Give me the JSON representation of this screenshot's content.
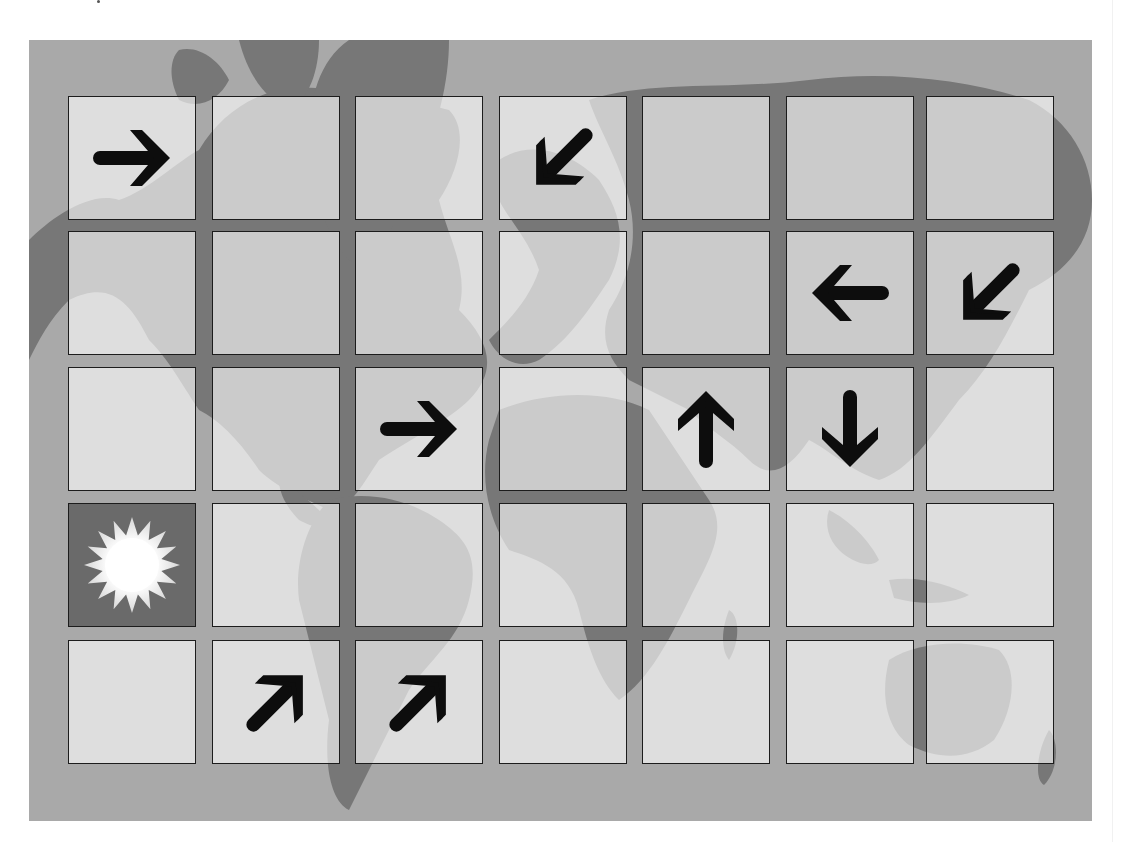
{
  "board": {
    "rows": 5,
    "cols": 7,
    "background": "world-map",
    "colors": {
      "ocean": "#a9a9a9",
      "land": "#777777",
      "cell_fill": "rgba(255,255,255,0.62)",
      "cell_border": "#1c1c1c",
      "arrow": "#0d0d0d",
      "sun_cell": "#6a6a6a",
      "sun": "#ffffff"
    },
    "cells": [
      [
        "arrow-right",
        "",
        "",
        "arrow-down-left",
        "",
        "",
        ""
      ],
      [
        "",
        "",
        "",
        "",
        "",
        "arrow-left",
        "arrow-down-left"
      ],
      [
        "",
        "",
        "arrow-right",
        "",
        "arrow-up",
        "arrow-down",
        ""
      ],
      [
        "sun",
        "",
        "",
        "",
        "",
        "",
        ""
      ],
      [
        "",
        "arrow-up-right",
        "arrow-up-right",
        "",
        "",
        "",
        ""
      ]
    ]
  }
}
